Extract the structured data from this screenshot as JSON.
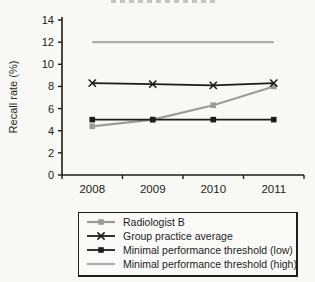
{
  "figure": {
    "background": "#f8f8f5",
    "cropped_title_visible": true
  },
  "chart_data": {
    "type": "line",
    "x": [
      "2008",
      "2009",
      "2010",
      "2011"
    ],
    "series": [
      {
        "name": "Radiologist B",
        "values": [
          4.4,
          5.0,
          6.3,
          8.0
        ],
        "color": "#9b9b9b",
        "marker": "square",
        "width": 2.2
      },
      {
        "name": "Group practice average",
        "values": [
          8.3,
          8.2,
          8.1,
          8.3
        ],
        "color": "#1c1c1c",
        "marker": "x",
        "width": 1.8
      },
      {
        "name": "Minimal performance threshold (low)",
        "values": [
          5,
          5,
          5,
          5
        ],
        "color": "#1c1c1c",
        "marker": "square",
        "width": 1.8
      },
      {
        "name": "Minimal performance threshold (high)",
        "values": [
          12,
          12,
          12,
          12
        ],
        "color": "#aeaeae",
        "marker": "none",
        "width": 2.2
      }
    ],
    "ylabel": "Recall rate (%)",
    "ylim": [
      0,
      14
    ],
    "yticks": [
      0,
      2,
      4,
      6,
      8,
      10,
      12,
      14
    ],
    "grid": false,
    "legend_position": "bottom",
    "axis_color": "#1c1c1c",
    "tick_label_color": "#222222"
  }
}
